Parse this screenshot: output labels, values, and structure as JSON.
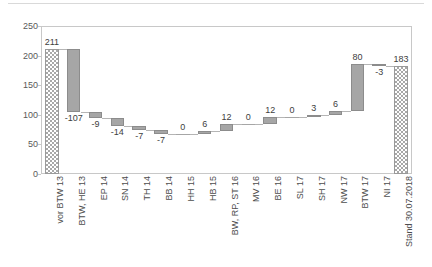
{
  "chart_data": {
    "type": "bar",
    "subtype": "waterfall",
    "title": "",
    "xlabel": "",
    "ylabel": "",
    "ylim": [
      0,
      250
    ],
    "yticks": [
      0,
      50,
      100,
      150,
      200,
      250
    ],
    "ytick_labels": [
      "0",
      "50",
      "100",
      "150",
      "200",
      "250"
    ],
    "grid": false,
    "legend": false,
    "categories": [
      "vor BTW 13",
      "BTW, HE 13",
      "EP 14",
      "SN 14",
      "TH 14",
      "BB 14",
      "HH 15",
      "HB 15",
      "BW, RP, ST 16",
      "MV 16",
      "BE 16",
      "SL 17",
      "SH 17",
      "NW 17",
      "BTW 17",
      "NI 17",
      "Stand 30.07.2018"
    ],
    "values": [
      211,
      -107,
      -9,
      -14,
      -7,
      -7,
      0,
      6,
      12,
      0,
      12,
      0,
      3,
      6,
      80,
      -3,
      183
    ],
    "data_labels": [
      "211",
      "-107",
      "-9",
      "-14",
      "-7",
      "-7",
      "0",
      "6",
      "12",
      "0",
      "12",
      "0",
      "3",
      "6",
      "80",
      "-3",
      "183"
    ],
    "cumulative": [
      211,
      104,
      95,
      81,
      74,
      67,
      67,
      73,
      85,
      85,
      97,
      97,
      100,
      106,
      186,
      183,
      183
    ],
    "bar_kinds": [
      "total",
      "delta",
      "delta",
      "delta",
      "delta",
      "delta",
      "delta",
      "delta",
      "delta",
      "delta",
      "delta",
      "delta",
      "delta",
      "delta",
      "delta",
      "delta",
      "total"
    ],
    "colors": {
      "total_fill": "#a8a8a8",
      "delta_fill": "#a6a6a6",
      "bar_border": "#8c8c8c",
      "connector": "#b5b5b5",
      "frame": "#c8c8c8",
      "tick_text": "#595959",
      "label_text": "#404040",
      "background": "#ffffff"
    }
  }
}
